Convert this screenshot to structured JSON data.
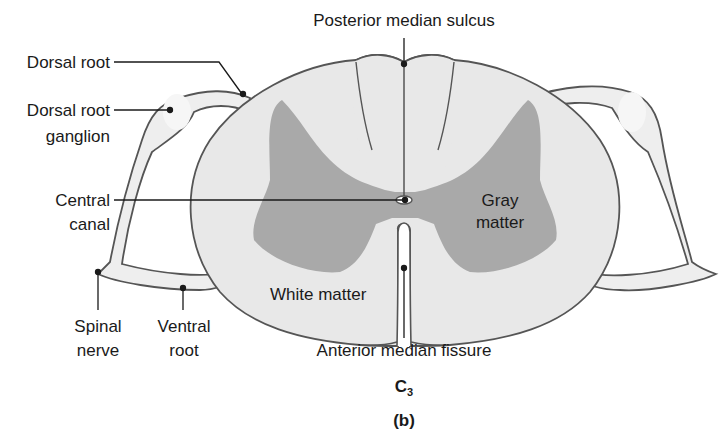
{
  "diagram": {
    "title": "C",
    "title_subscript": "3",
    "panel_label": "(b)",
    "colors": {
      "white_matter": "#e8e8e8",
      "gray_matter": "#a9a9a9",
      "outline": "#555555",
      "nerve": "#eeeeee",
      "leader": "#1a1a1a"
    },
    "labels": {
      "posterior_median_sulcus": "Posterior median sulcus",
      "dorsal_root": "Dorsal root",
      "dorsal_root_ganglion_1": "Dorsal root",
      "dorsal_root_ganglion_2": "ganglion",
      "central_canal_1": "Central",
      "central_canal_2": "canal",
      "gray_matter_1": "Gray",
      "gray_matter_2": "matter",
      "white_matter": "White matter",
      "spinal_nerve_1": "Spinal",
      "spinal_nerve_2": "nerve",
      "ventral_root_1": "Ventral",
      "ventral_root_2": "root",
      "anterior_median_fissure": "Anterior median fissure"
    }
  }
}
